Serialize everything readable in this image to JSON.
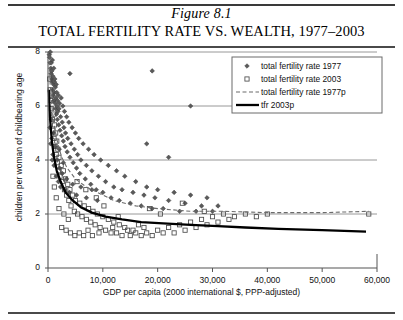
{
  "figure": {
    "number": "Figure 8.1",
    "title": "TOTAL FERTILITY RATE VS. WEALTH, 1977–2003"
  },
  "chart_data": {
    "type": "scatter",
    "title": "Total Fertility Rate vs. Wealth, 1977–2003",
    "xlabel": "GDP per capita (2000 international $, PPP-adjusted)",
    "ylabel": "children per woman of childbearing age",
    "xlim": [
      0,
      60000
    ],
    "ylim": [
      0,
      8
    ],
    "xticks": [
      0,
      10000,
      20000,
      30000,
      40000,
      50000,
      60000
    ],
    "xtick_labels": [
      "0",
      "10,000",
      "20,000",
      "30,000",
      "40,000",
      "50,000",
      "60,000"
    ],
    "yticks": [
      0,
      2,
      4,
      6,
      8
    ],
    "ytick_labels": [
      "0",
      "2",
      "4",
      "6",
      "8"
    ],
    "grid": "horizontal",
    "legend_position": "top-right",
    "series": [
      {
        "name": "total fertility rate 1977",
        "marker": "diamond",
        "color": "#555555",
        "points": [
          [
            250,
            7.9
          ],
          [
            300,
            7.8
          ],
          [
            380,
            7.6
          ],
          [
            420,
            8.0
          ],
          [
            500,
            7.4
          ],
          [
            560,
            7.2
          ],
          [
            610,
            7.6
          ],
          [
            660,
            7.0
          ],
          [
            700,
            7.3
          ],
          [
            740,
            6.9
          ],
          [
            800,
            7.7
          ],
          [
            850,
            6.6
          ],
          [
            900,
            7.1
          ],
          [
            950,
            6.4
          ],
          [
            1000,
            6.8
          ],
          [
            1050,
            7.4
          ],
          [
            1100,
            6.2
          ],
          [
            1150,
            6.9
          ],
          [
            1200,
            6.5
          ],
          [
            1250,
            7.0
          ],
          [
            1300,
            6.1
          ],
          [
            1350,
            6.7
          ],
          [
            1400,
            5.9
          ],
          [
            1450,
            6.3
          ],
          [
            1500,
            6.8
          ],
          [
            1550,
            5.7
          ],
          [
            1600,
            6.5
          ],
          [
            1650,
            6.0
          ],
          [
            1700,
            5.5
          ],
          [
            1750,
            6.2
          ],
          [
            1800,
            5.8
          ],
          [
            1900,
            6.4
          ],
          [
            1950,
            5.3
          ],
          [
            2000,
            5.9
          ],
          [
            2100,
            6.1
          ],
          [
            2200,
            5.1
          ],
          [
            2300,
            5.6
          ],
          [
            2400,
            6.3
          ],
          [
            2500,
            4.9
          ],
          [
            2600,
            5.4
          ],
          [
            2700,
            6.0
          ],
          [
            2800,
            4.7
          ],
          [
            2900,
            5.2
          ],
          [
            3000,
            5.8
          ],
          [
            3100,
            4.5
          ],
          [
            3200,
            5.0
          ],
          [
            3400,
            5.6
          ],
          [
            3500,
            4.3
          ],
          [
            3600,
            4.8
          ],
          [
            3800,
            5.4
          ],
          [
            4000,
            4.1
          ],
          [
            4200,
            4.6
          ],
          [
            4400,
            5.2
          ],
          [
            4600,
            3.9
          ],
          [
            4800,
            4.4
          ],
          [
            5000,
            5.0
          ],
          [
            5200,
            3.7
          ],
          [
            5400,
            4.2
          ],
          [
            5600,
            4.8
          ],
          [
            5800,
            3.5
          ],
          [
            6000,
            4.0
          ],
          [
            6400,
            4.6
          ],
          [
            6800,
            3.3
          ],
          [
            7000,
            3.8
          ],
          [
            7400,
            4.4
          ],
          [
            7800,
            3.1
          ],
          [
            8000,
            3.6
          ],
          [
            8400,
            4.2
          ],
          [
            8800,
            2.9
          ],
          [
            9200,
            3.4
          ],
          [
            9600,
            4.0
          ],
          [
            10000,
            2.8
          ],
          [
            10500,
            3.2
          ],
          [
            11000,
            3.8
          ],
          [
            11500,
            2.6
          ],
          [
            12000,
            3.0
          ],
          [
            12500,
            3.6
          ],
          [
            13000,
            2.5
          ],
          [
            13500,
            2.9
          ],
          [
            14000,
            3.4
          ],
          [
            15000,
            2.4
          ],
          [
            15500,
            2.8
          ],
          [
            16000,
            3.2
          ],
          [
            17000,
            2.3
          ],
          [
            17500,
            2.7
          ],
          [
            18000,
            3.0
          ],
          [
            19000,
            2.2
          ],
          [
            19500,
            2.6
          ],
          [
            20000,
            2.9
          ],
          [
            21000,
            2.2
          ],
          [
            22000,
            2.5
          ],
          [
            23000,
            2.8
          ],
          [
            24000,
            2.1
          ],
          [
            25000,
            2.4
          ],
          [
            26000,
            2.7
          ],
          [
            27000,
            2.1
          ],
          [
            28000,
            2.3
          ],
          [
            29000,
            2.6
          ],
          [
            30000,
            2.1
          ],
          [
            31000,
            2.3
          ],
          [
            700,
            4.8
          ],
          [
            900,
            4.2
          ],
          [
            1100,
            3.8
          ],
          [
            1300,
            4.5
          ],
          [
            1500,
            3.4
          ],
          [
            1700,
            4.0
          ],
          [
            1900,
            3.2
          ],
          [
            2100,
            3.7
          ],
          [
            2300,
            3.0
          ],
          [
            2600,
            3.5
          ],
          [
            3000,
            2.9
          ],
          [
            3400,
            3.3
          ],
          [
            3900,
            2.8
          ],
          [
            4500,
            3.1
          ],
          [
            5200,
            2.7
          ],
          [
            6000,
            3.0
          ],
          [
            7000,
            2.6
          ],
          [
            8000,
            2.9
          ],
          [
            9000,
            2.5
          ],
          [
            19000,
            7.3
          ],
          [
            26000,
            6.0
          ],
          [
            18000,
            4.6
          ],
          [
            22000,
            4.1
          ],
          [
            4000,
            7.2
          ],
          [
            350,
            5.2
          ],
          [
            480,
            4.6
          ],
          [
            620,
            5.5
          ],
          [
            760,
            4.0
          ],
          [
            1020,
            5.0
          ],
          [
            2050,
            4.4
          ],
          [
            2800,
            3.9
          ]
        ]
      },
      {
        "name": "total fertility rate 2003",
        "marker": "square",
        "color": "#555555",
        "points": [
          [
            300,
            7.0
          ],
          [
            400,
            6.6
          ],
          [
            500,
            6.2
          ],
          [
            600,
            5.9
          ],
          [
            700,
            6.4
          ],
          [
            800,
            5.5
          ],
          [
            900,
            5.1
          ],
          [
            1000,
            5.7
          ],
          [
            1100,
            4.8
          ],
          [
            1200,
            5.3
          ],
          [
            1300,
            4.5
          ],
          [
            1400,
            5.0
          ],
          [
            1500,
            4.2
          ],
          [
            1600,
            4.7
          ],
          [
            1700,
            3.9
          ],
          [
            1800,
            4.4
          ],
          [
            1900,
            3.6
          ],
          [
            2000,
            4.1
          ],
          [
            2200,
            3.4
          ],
          [
            2400,
            3.8
          ],
          [
            2600,
            3.2
          ],
          [
            2800,
            3.6
          ],
          [
            3000,
            2.9
          ],
          [
            3200,
            3.3
          ],
          [
            3400,
            2.7
          ],
          [
            3600,
            3.1
          ],
          [
            3800,
            2.5
          ],
          [
            4000,
            2.9
          ],
          [
            4200,
            2.3
          ],
          [
            4500,
            2.7
          ],
          [
            4800,
            2.1
          ],
          [
            5000,
            2.5
          ],
          [
            5400,
            2.0
          ],
          [
            5800,
            2.4
          ],
          [
            6200,
            1.9
          ],
          [
            6600,
            2.3
          ],
          [
            7000,
            1.8
          ],
          [
            7400,
            2.2
          ],
          [
            7800,
            1.7
          ],
          [
            8200,
            2.1
          ],
          [
            8600,
            1.6
          ],
          [
            9000,
            2.0
          ],
          [
            9500,
            1.5
          ],
          [
            10000,
            1.9
          ],
          [
            10500,
            1.4
          ],
          [
            11000,
            1.8
          ],
          [
            11500,
            1.3
          ],
          [
            12000,
            1.7
          ],
          [
            12500,
            1.3
          ],
          [
            13000,
            1.6
          ],
          [
            13500,
            1.2
          ],
          [
            14000,
            1.5
          ],
          [
            15000,
            1.2
          ],
          [
            15500,
            1.4
          ],
          [
            16000,
            1.3
          ],
          [
            17000,
            1.2
          ],
          [
            17500,
            1.5
          ],
          [
            18000,
            1.3
          ],
          [
            19000,
            1.2
          ],
          [
            20000,
            1.4
          ],
          [
            21000,
            1.3
          ],
          [
            22000,
            1.5
          ],
          [
            23000,
            1.3
          ],
          [
            24000,
            1.6
          ],
          [
            25000,
            1.4
          ],
          [
            26000,
            1.7
          ],
          [
            27000,
            1.5
          ],
          [
            28000,
            1.8
          ],
          [
            29000,
            1.6
          ],
          [
            30000,
            1.9
          ],
          [
            31000,
            1.7
          ],
          [
            32000,
            2.0
          ],
          [
            33000,
            1.8
          ],
          [
            34000,
            1.9
          ],
          [
            36000,
            2.0
          ],
          [
            38000,
            1.9
          ],
          [
            40000,
            2.0
          ],
          [
            58500,
            2.0
          ],
          [
            2500,
            1.5
          ],
          [
            3300,
            1.4
          ],
          [
            4100,
            1.3
          ],
          [
            4900,
            1.2
          ],
          [
            5700,
            1.3
          ],
          [
            6500,
            1.2
          ],
          [
            7300,
            1.4
          ],
          [
            8100,
            1.2
          ],
          [
            9300,
            1.3
          ],
          [
            11800,
            1.5
          ],
          [
            14500,
            1.4
          ],
          [
            16500,
            1.6
          ],
          [
            12800,
            1.9
          ],
          [
            10200,
            2.3
          ],
          [
            8800,
            2.6
          ],
          [
            6900,
            2.9
          ],
          [
            5300,
            3.2
          ],
          [
            1500,
            2.6
          ],
          [
            2000,
            2.2
          ],
          [
            2900,
            2.0
          ],
          [
            3700,
            1.8
          ],
          [
            900,
            3.4
          ],
          [
            1150,
            3.0
          ],
          [
            24500,
            2.4
          ],
          [
            20500,
            2.0
          ],
          [
            18500,
            2.2
          ],
          [
            28500,
            2.1
          ]
        ]
      },
      {
        "name": "total fertility rate 1977p",
        "type": "line",
        "style": "dashed",
        "color": "#666666",
        "description": "fitted power-law trend for 1977",
        "points": [
          [
            150,
            7.9
          ],
          [
            400,
            6.8
          ],
          [
            800,
            5.8
          ],
          [
            1200,
            5.2
          ],
          [
            1800,
            4.6
          ],
          [
            2500,
            4.1
          ],
          [
            3500,
            3.7
          ],
          [
            5000,
            3.3
          ],
          [
            7000,
            3.0
          ],
          [
            9000,
            2.8
          ],
          [
            12000,
            2.5
          ],
          [
            16000,
            2.3
          ],
          [
            20000,
            2.2
          ],
          [
            26000,
            2.1
          ],
          [
            32000,
            2.1
          ],
          [
            40000,
            2.05
          ],
          [
            50000,
            2.05
          ],
          [
            58500,
            2.1
          ]
        ]
      },
      {
        "name": "tfr 2003p",
        "type": "line",
        "style": "solid-thick",
        "color": "#000000",
        "description": "fitted power-law trend for 2003",
        "points": [
          [
            150,
            6.6
          ],
          [
            350,
            5.6
          ],
          [
            700,
            4.7
          ],
          [
            1100,
            4.1
          ],
          [
            1600,
            3.6
          ],
          [
            2300,
            3.2
          ],
          [
            3200,
            2.8
          ],
          [
            4500,
            2.5
          ],
          [
            6000,
            2.25
          ],
          [
            8000,
            2.05
          ],
          [
            10500,
            1.9
          ],
          [
            13500,
            1.8
          ],
          [
            17000,
            1.7
          ],
          [
            21000,
            1.65
          ],
          [
            26000,
            1.6
          ],
          [
            31000,
            1.55
          ],
          [
            36000,
            1.5
          ],
          [
            42000,
            1.45
          ],
          [
            50000,
            1.4
          ],
          [
            58000,
            1.35
          ]
        ]
      }
    ]
  },
  "legend": {
    "items": [
      {
        "label": "total fertility rate 1977",
        "marker": "diamond"
      },
      {
        "label": "total fertility rate 2003",
        "marker": "square"
      },
      {
        "label": "total fertility rate 1977p",
        "marker": "dashed-line"
      },
      {
        "label": "tfr 2003p",
        "marker": "thick-line"
      }
    ]
  }
}
